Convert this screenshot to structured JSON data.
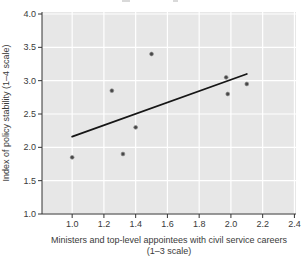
{
  "figure": {
    "x_axis_title_line1": "Ministers and top-level appointees with civil service careers",
    "x_axis_title_line2": "(1–3 scale)",
    "y_axis_title": "Index of policy stability (1–4 scale)"
  },
  "chart_data": {
    "type": "scatter",
    "title": "",
    "xlabel": "Ministers and top-level appointees with civil service careers (1–3 scale)",
    "ylabel": "Index of policy stability (1–4 scale)",
    "points": [
      {
        "x": 1.0,
        "y": 1.85
      },
      {
        "x": 1.25,
        "y": 2.85
      },
      {
        "x": 1.32,
        "y": 1.9
      },
      {
        "x": 1.4,
        "y": 2.3
      },
      {
        "x": 1.5,
        "y": 3.4
      },
      {
        "x": 1.97,
        "y": 3.05
      },
      {
        "x": 1.98,
        "y": 2.8
      },
      {
        "x": 2.1,
        "y": 2.95
      }
    ],
    "trend_line": {
      "x1": 1.0,
      "y1": 2.16,
      "x2": 2.1,
      "y2": 3.1
    },
    "xlim": [
      0.81,
      2.41
    ],
    "ylim": [
      1.0,
      4.03
    ],
    "xticks": [
      1.0,
      1.2,
      1.4,
      1.6,
      1.8,
      2.0,
      2.2,
      2.4
    ],
    "yticks": [
      1.0,
      1.5,
      2.0,
      2.5,
      3.0,
      3.5,
      4.0
    ],
    "grid": true,
    "legend": "none",
    "colors": {
      "plot_bg": "#e7e7e7",
      "grid": "#ffffff",
      "marker": "#474747",
      "marker_edge": "#8f8f8f",
      "trend": "#161616",
      "axis": "#333333",
      "text": "#3a3a3a"
    }
  }
}
